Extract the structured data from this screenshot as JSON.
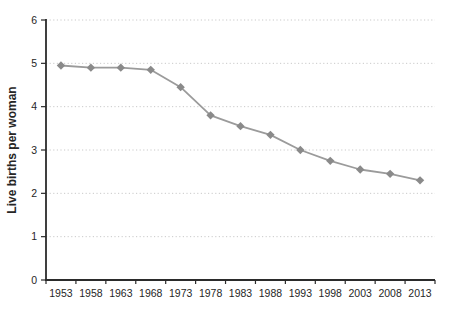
{
  "chart_data": {
    "type": "line",
    "categories": [
      "1953",
      "1958",
      "1963",
      "1968",
      "1973",
      "1978",
      "1983",
      "1988",
      "1993",
      "1998",
      "2003",
      "2008",
      "2013"
    ],
    "series": [
      {
        "name": "Live births per woman",
        "values": [
          4.95,
          4.9,
          4.9,
          4.85,
          4.45,
          3.8,
          3.55,
          3.35,
          3.0,
          2.75,
          2.55,
          2.45,
          2.3
        ]
      }
    ],
    "title": "",
    "xlabel": "",
    "ylabel": "Live births per woman",
    "ylim": [
      0,
      6
    ],
    "yticks": [
      0,
      1,
      2,
      3,
      4,
      5,
      6
    ],
    "grid": "dotted-horizontal",
    "legend": "none",
    "marker": "diamond",
    "line_color": "#9b9b9b",
    "marker_color": "#8a8a8a",
    "axis_color": "#2b2b2b",
    "gridline_color": "#c9c9c9",
    "tick_label_color": "#262626"
  }
}
